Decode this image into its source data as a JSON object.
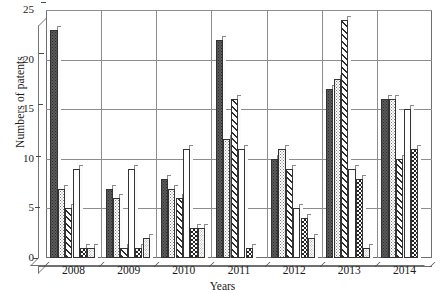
{
  "chart_data": {
    "type": "bar",
    "title": "",
    "xlabel": "Years",
    "ylabel": "Numbers of patents",
    "categories": [
      "2008",
      "2009",
      "2010",
      "2011",
      "2012",
      "2013",
      "2014"
    ],
    "ylim": [
      0,
      25
    ],
    "yticks": [
      0,
      5,
      10,
      15,
      20,
      25
    ],
    "grid": true,
    "legend_position": "none",
    "series": [
      {
        "name": "series-1-dark-dotted",
        "pattern": "dark-dot",
        "values": [
          23,
          7,
          8,
          22,
          10,
          17,
          16
        ]
      },
      {
        "name": "series-2-light-dotted",
        "pattern": "light-dot",
        "values": [
          7,
          6,
          7,
          12,
          11,
          18,
          16
        ]
      },
      {
        "name": "series-3-diagonal-hatch",
        "pattern": "diagonal",
        "values": [
          5,
          1,
          6,
          16,
          9,
          24,
          10
        ]
      },
      {
        "name": "series-4-plain-white",
        "pattern": "plain",
        "values": [
          9,
          9,
          11,
          11,
          5,
          9,
          15
        ]
      },
      {
        "name": "series-5-checkerboard",
        "pattern": "checker",
        "values": [
          1,
          1,
          3,
          1,
          4,
          8,
          11
        ]
      },
      {
        "name": "series-6-fine-dotted",
        "pattern": "small-dot",
        "values": [
          1,
          2,
          3,
          0,
          2,
          1,
          0
        ]
      }
    ]
  },
  "axes": {
    "y_tick_labels": [
      "0",
      "5",
      "10",
      "15",
      "20",
      "25"
    ],
    "y_axis_title": "Numbers of patents",
    "x_tick_labels": [
      "2008",
      "2009",
      "2010",
      "2011",
      "2012",
      "2013",
      "2014"
    ],
    "x_axis_title": "Years"
  },
  "artifacts": {
    "ghost_text": ""
  }
}
